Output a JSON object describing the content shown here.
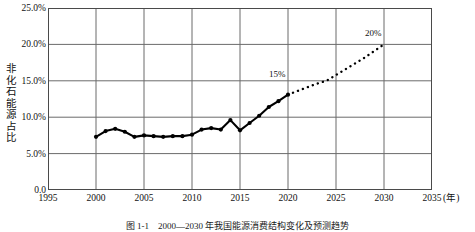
{
  "figure": {
    "caption": "图 1-1　2000—2030 年我国能源消费结构变化及预测趋势",
    "xunit": "(年)"
  },
  "chart_data": {
    "type": "line",
    "title": "",
    "xlabel": "",
    "ylabel": "非化石能源占比",
    "xlim": [
      1995,
      2035
    ],
    "ylim": [
      0,
      25
    ],
    "grid": true,
    "legend": false,
    "xticks": [
      "1995",
      "2000",
      "2005",
      "2010",
      "2015",
      "2020",
      "2025",
      "2030",
      "2035"
    ],
    "xtick_values": [
      1995,
      2000,
      2005,
      2010,
      2015,
      2020,
      2025,
      2030,
      2035
    ],
    "yticks": [
      "0.0",
      "5.0%",
      "10.0%",
      "15.0%",
      "20.0%",
      "25.0%"
    ],
    "ytick_values": [
      0,
      5,
      10,
      15,
      20,
      25
    ],
    "series": [
      {
        "name": "历史值",
        "style": "solid-with-markers",
        "color": "#000000",
        "x": [
          2000,
          2001,
          2002,
          2003,
          2004,
          2005,
          2006,
          2007,
          2008,
          2009,
          2010,
          2011,
          2012,
          2013,
          2014,
          2015,
          2016,
          2017,
          2018,
          2019,
          2020
        ],
        "values": [
          7.3,
          8.1,
          8.4,
          8.0,
          7.3,
          7.5,
          7.4,
          7.3,
          7.4,
          7.4,
          7.6,
          8.3,
          8.5,
          8.3,
          9.6,
          8.2,
          9.2,
          10.2,
          11.4,
          12.2,
          13.1
        ]
      },
      {
        "name": "预测值",
        "style": "dotted",
        "color": "#000000",
        "x": [
          2020,
          2021,
          2022,
          2023,
          2024,
          2025,
          2026,
          2027,
          2028,
          2029,
          2030
        ],
        "values": [
          13.1,
          13.6,
          14.1,
          14.6,
          15.0,
          15.8,
          16.6,
          17.4,
          18.2,
          19.1,
          20.0
        ]
      }
    ],
    "annotations": [
      {
        "label": "15%",
        "x": 2020,
        "y": 15.0
      },
      {
        "label": "20%",
        "x": 2030,
        "y": 20.6
      }
    ]
  }
}
